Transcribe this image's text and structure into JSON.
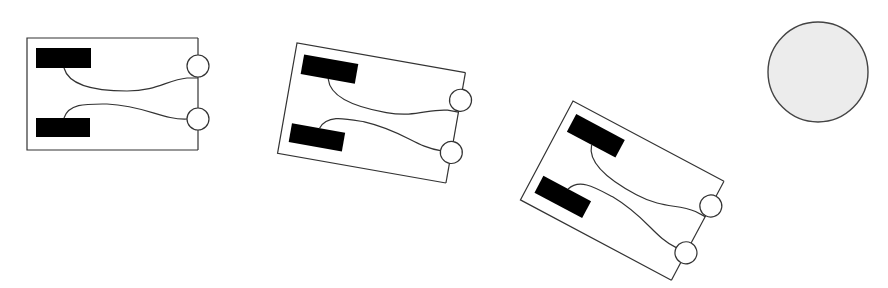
{
  "diagram": {
    "colors": {
      "background": "#ffffff",
      "outline": "#333333",
      "pad": "#000000",
      "disc_fill": "#ececec",
      "disc_stroke": "#444444"
    },
    "cards": [
      {
        "id": "card-1",
        "rotation_deg": 0,
        "origin": [
          27,
          38
        ]
      },
      {
        "id": "card-2",
        "rotation_deg": 10,
        "origin": [
          297,
          43
        ]
      },
      {
        "id": "card-3",
        "rotation_deg": 28,
        "origin": [
          573,
          101
        ]
      }
    ],
    "disc": {
      "cx": 818,
      "cy": 72,
      "r": 50
    }
  }
}
